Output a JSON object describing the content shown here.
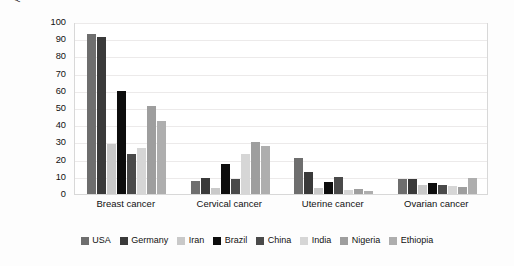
{
  "chart_data": {
    "type": "bar",
    "title": "",
    "xlabel": "",
    "ylabel": "Age-standardized incidence of cancer per 100,000 women",
    "ylim": [
      0,
      100
    ],
    "ytick_labels": [
      "0",
      "10",
      "20",
      "30",
      "40",
      "50",
      "60",
      "70",
      "80",
      "90",
      "100"
    ],
    "ytick_values": [
      0,
      10,
      20,
      30,
      40,
      50,
      60,
      70,
      80,
      90,
      100
    ],
    "grid": "horizontal",
    "legend_position": "bottom",
    "categories": [
      "Breast cancer",
      "Cervical cancer",
      "Uterine cancer",
      "Ovarian cancer"
    ],
    "series": [
      {
        "name": "USA",
        "color": "#6e6e6e",
        "values": [
          93.0,
          7.5,
          21.0,
          9.0
        ]
      },
      {
        "name": "Germany",
        "color": "#3a3a3a",
        "values": [
          91.5,
          9.5,
          13.0,
          8.5
        ]
      },
      {
        "name": "Iran",
        "color": "#c9c9c9",
        "values": [
          29.0,
          3.5,
          3.5,
          5.5
        ]
      },
      {
        "name": "Brazil",
        "color": "#0d0d0d",
        "values": [
          60.0,
          17.5,
          7.0,
          6.5
        ]
      },
      {
        "name": "China",
        "color": "#4a4a4a",
        "values": [
          23.0,
          9.0,
          10.0,
          5.5
        ]
      },
      {
        "name": "India",
        "color": "#d6d6d6",
        "values": [
          27.0,
          23.0,
          2.5,
          4.5
        ]
      },
      {
        "name": "Nigeria",
        "color": "#9e9e9e",
        "values": [
          51.0,
          30.5,
          3.0,
          4.0
        ]
      },
      {
        "name": "Ethiopia",
        "color": "#aeaeae",
        "values": [
          42.5,
          28.0,
          2.0,
          9.5
        ]
      }
    ]
  }
}
